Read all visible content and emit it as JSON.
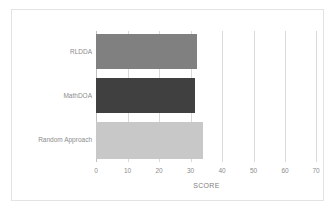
{
  "chart_data": {
    "type": "bar",
    "orientation": "horizontal",
    "title": "",
    "xlabel": "SCORE",
    "ylabel": "",
    "categories": [
      "RLDDA",
      "MathDOA",
      "Random Approach"
    ],
    "values": [
      32,
      31.5,
      34
    ],
    "xlim": [
      0,
      70
    ],
    "xticks": [
      0,
      10,
      20,
      30,
      40,
      50,
      60,
      70
    ],
    "xtick_labels": [
      "0",
      "10",
      "20",
      "30",
      "40",
      "50",
      "60",
      "70"
    ],
    "grid": true,
    "grid_axis": "x",
    "legend": false,
    "bar_colors": [
      "#808080",
      "#404040",
      "#c8c8c8"
    ],
    "series": [
      {
        "name": "SCORE",
        "values": [
          32,
          31.5,
          34
        ]
      }
    ],
    "colors": {
      "grid": "#d9d9d9",
      "axis": "#bfbfbf",
      "text": "#8c8c8c",
      "frame": "#e3e3e3",
      "background": "#ffffff"
    }
  }
}
